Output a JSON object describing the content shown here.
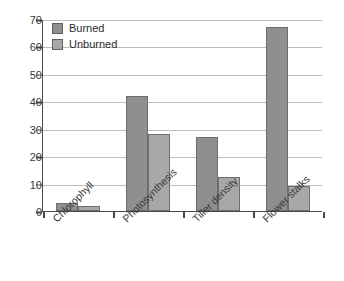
{
  "chart_data": {
    "type": "bar",
    "title": "",
    "subtitle": "",
    "xlabel": "",
    "ylabel": "",
    "categories": [
      "Chlorophyll",
      "Photosynthesis",
      "Tiller density",
      "Flower stalks"
    ],
    "series": [
      {
        "name": "Burned",
        "values": [
          3,
          42,
          27,
          67
        ],
        "color": "#8f8f8f"
      },
      {
        "name": "Unburned",
        "values": [
          2,
          28,
          12.5,
          9
        ],
        "color": "#a8a8a8"
      }
    ],
    "ylim": [
      0,
      70
    ],
    "ytick_values": [
      0,
      10,
      20,
      30,
      40,
      50,
      60,
      70
    ],
    "ytick_labels": [
      "0",
      "10",
      "20",
      "30",
      "40",
      "50",
      "60",
      "70"
    ],
    "grid": true,
    "grid_axis": "y",
    "legend_position": "top-left",
    "bar_border_color": "#6d6d6d",
    "axis_color": "#4a4a4a",
    "gridline_color": "#bdbdbd",
    "xtick_label_rotation": -45
  }
}
